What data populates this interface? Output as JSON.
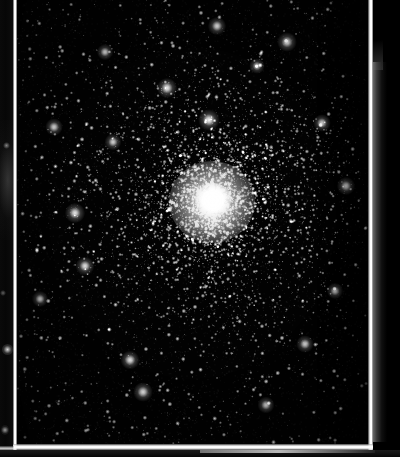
{
  "image": {
    "subject_name": "globular-star-cluster",
    "medium": "photographic plate scan",
    "width": 400,
    "height": 457,
    "background_color": "#000000",
    "caption": ""
  },
  "frame": {
    "line_color": "#ffffff",
    "left_line_x": 13,
    "left_line_width": 4,
    "right_line_x": 368,
    "right_line_width": 5,
    "bottom_line_y": 444,
    "bottom_line_height": 6,
    "margin_color": "#0a0a0a",
    "right_strip_start_y": 62,
    "right_strip_color": "#767676"
  },
  "sky": {
    "field_x": 17,
    "field_y": 0,
    "field_width": 351,
    "field_height": 444,
    "sky_color": "#020202",
    "star_color": "#ffffff"
  },
  "chart_data": {
    "type": "scatter",
    "title": "",
    "xlabel": "",
    "ylabel": "",
    "xlim": [
      0,
      351
    ],
    "ylim": [
      0,
      444
    ],
    "grid": false,
    "legend": false,
    "cluster": {
      "name": "globular-cluster-core",
      "center_x": 195,
      "center_y": 202,
      "core_radius": 43,
      "peak_radius": 18,
      "halo_mid_radius": 84,
      "halo_outer_radius": 150,
      "peak_brightness": 255,
      "star_count": 6200
    },
    "field_stars": {
      "name": "background-field-stars",
      "count": 2600,
      "brightness_range": [
        40,
        255
      ]
    },
    "notable_stars": [
      {
        "x": 58,
        "y": 213,
        "brightness": 230,
        "size": 3.0
      },
      {
        "x": 37,
        "y": 127,
        "brightness": 215,
        "size": 2.6
      },
      {
        "x": 68,
        "y": 266,
        "brightness": 225,
        "size": 2.8
      },
      {
        "x": 23,
        "y": 299,
        "brightness": 205,
        "size": 2.4
      },
      {
        "x": 96,
        "y": 142,
        "brightness": 210,
        "size": 2.5
      },
      {
        "x": 150,
        "y": 88,
        "brightness": 235,
        "size": 3.0
      },
      {
        "x": 192,
        "y": 120,
        "brightness": 245,
        "size": 3.2
      },
      {
        "x": 270,
        "y": 42,
        "brightness": 230,
        "size": 2.9
      },
      {
        "x": 305,
        "y": 123,
        "brightness": 215,
        "size": 2.6
      },
      {
        "x": 329,
        "y": 186,
        "brightness": 220,
        "size": 2.7
      },
      {
        "x": 318,
        "y": 291,
        "brightness": 205,
        "size": 2.4
      },
      {
        "x": 288,
        "y": 344,
        "brightness": 215,
        "size": 2.6
      },
      {
        "x": 113,
        "y": 360,
        "brightness": 225,
        "size": 2.8
      },
      {
        "x": 126,
        "y": 392,
        "brightness": 230,
        "size": 2.9
      },
      {
        "x": 249,
        "y": 405,
        "brightness": 210,
        "size": 2.5
      },
      {
        "x": 200,
        "y": 26,
        "brightness": 225,
        "size": 2.7
      },
      {
        "x": 240,
        "y": 66,
        "brightness": 200,
        "size": 2.3
      },
      {
        "x": 88,
        "y": 52,
        "brightness": 205,
        "size": 2.4
      }
    ]
  }
}
